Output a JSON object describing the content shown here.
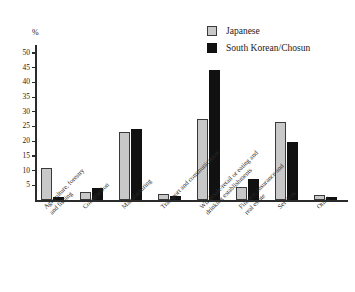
{
  "chart_data": {
    "type": "bar",
    "title": "",
    "xlabel": "",
    "ylabel": "%",
    "ylim": [
      0,
      52
    ],
    "grid": false,
    "legend_position": "top-right",
    "categories": [
      "Agriculture, forestry\nand fishing",
      "Construction",
      "Manufacturing",
      "Transport and communication",
      "Wholesale/retail or eating and\ndrinking establishments",
      "Finance, insurance and\nreal estate",
      "Services",
      "Other"
    ],
    "series": [
      {
        "name": "Japanese",
        "color": "#c8c8c8",
        "values": [
          10.8,
          2.8,
          23.0,
          2.0,
          27.6,
          4.5,
          26.6,
          1.8
        ]
      },
      {
        "name": "South Korean/Chosun",
        "color": "#111111",
        "values": [
          1.0,
          4.0,
          24.3,
          1.2,
          44.2,
          7.0,
          19.7,
          1.0
        ]
      }
    ],
    "y_ticks": [
      5,
      10,
      15,
      20,
      25,
      30,
      35,
      40,
      45,
      50
    ],
    "y_tick_labels": [
      "5",
      "10",
      "15",
      "20",
      "25",
      "30",
      "35",
      "40",
      "45",
      "50"
    ]
  },
  "axis": {
    "unit_label": "%"
  },
  "legend": {
    "items": [
      {
        "label": "Japanese"
      },
      {
        "label": "South Korean/Chosun"
      }
    ]
  }
}
